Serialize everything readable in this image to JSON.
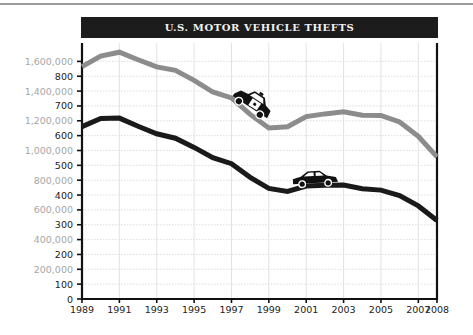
{
  "chart_data": {
    "type": "line",
    "title": "U.S. MOTOR VEHICLE THEFTS",
    "xlabel": "",
    "ylabel": "",
    "x": [
      1989,
      1990,
      1991,
      1992,
      1993,
      1994,
      1995,
      1996,
      1997,
      1998,
      1999,
      2000,
      2001,
      2002,
      2003,
      2004,
      2005,
      2006,
      2007,
      2008
    ],
    "x_tick_labels": [
      "1989",
      "1991",
      "1993",
      "1995",
      "1997",
      "1999",
      "2001",
      "2003",
      "2005",
      "2007",
      "2008"
    ],
    "xlim": [
      1989,
      2008
    ],
    "grid": true,
    "legend": "none",
    "axes": {
      "gray_scale": {
        "ylim": [
          0,
          1600000
        ],
        "tick_labels": [
          "200,000",
          "400,000",
          "600,000",
          "800,000",
          "1,000,000",
          "1,200,000",
          "1,400,000",
          "1,600,000"
        ],
        "tick_values": [
          200000,
          400000,
          600000,
          800000,
          1000000,
          1200000,
          1400000,
          1600000
        ]
      },
      "black_scale": {
        "tick_labels": [
          "100",
          "200",
          "300",
          "400",
          "500",
          "600",
          "700",
          "800"
        ],
        "tick_values": [
          100,
          200,
          300,
          400,
          500,
          600,
          700,
          800
        ]
      },
      "zero_label": "0"
    },
    "series": [
      {
        "name": "Total thefts",
        "color": "#8c8c8c",
        "scale": "gray_scale",
        "icon": "police-car",
        "values": [
          1564800,
          1635907,
          1661738,
          1610834,
          1563060,
          1539287,
          1472441,
          1394238,
          1354189,
          1242781,
          1152075,
          1160002,
          1228391,
          1246646,
          1261226,
          1237851,
          1235859,
          1192809,
          1095769,
          956846
        ]
      },
      {
        "name": "Thefts per 100,000 inhabitants",
        "color": "#1a1a1a",
        "scale": "black_scale",
        "icon": "sedan-car",
        "values": [
          630.4,
          657.8,
          659.0,
          631.6,
          606.3,
          591.3,
          560.3,
          525.7,
          505.7,
          459.9,
          422.5,
          412.2,
          430.5,
          432.9,
          433.7,
          421.5,
          416.8,
          398.4,
          363.3,
          314.7
        ]
      }
    ]
  }
}
